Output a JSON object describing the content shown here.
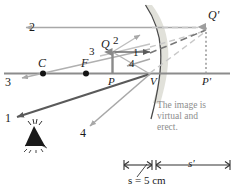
{
  "figure": {
    "type": "ray-diagram",
    "caption_text": {
      "line1": "The image is",
      "line2": "virtual and",
      "line3": "erect."
    },
    "caption_color": "#8d8d8d"
  },
  "axis_points": {
    "center_of_curvature": "C",
    "focal_point": "F",
    "object_base": "P",
    "vertex": "V",
    "image_base": "P'",
    "object_tip": "Q",
    "image_tip": "Q'"
  },
  "ray_labels": {
    "ray1_left": "1",
    "ray1_mid": "1",
    "ray2_left": "2",
    "ray2_mid": "2",
    "ray3_left": "3",
    "ray3_mid": "3",
    "ray4_mid": "4",
    "ray4_lower": "4"
  },
  "dimensions": {
    "object_distance_label": "s = 5 cm",
    "image_distance_label": "s'"
  },
  "colors": {
    "axis": "#8c8c8c",
    "ray_light_gray": "#a8a8a8",
    "ray_dark": "#5a5a5a",
    "ray_medium": "#9a9a9a",
    "mirror": "#4a4a4a",
    "mirror_glow": "#d8d8d0",
    "object_arrow": "#8a8a8a",
    "image_arrow": "#9e9e9e",
    "text": "#1a1a1a",
    "caption": "#8d8d8d",
    "dot": "#141414"
  }
}
